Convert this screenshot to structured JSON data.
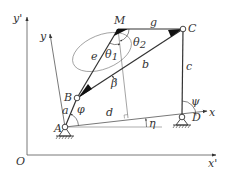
{
  "diagram": {
    "colors": {
      "line": "#333333",
      "axis": "#555555",
      "ellipse": "#777777",
      "background": "#ffffff"
    },
    "frames": {
      "global": {
        "origin_label": "O",
        "x_label": "x'",
        "y_label": "y'"
      },
      "local": {
        "x_label": "x",
        "y_label": "y"
      }
    },
    "joints": {
      "A": "A",
      "B": "B",
      "C": "C",
      "D": "D",
      "M": "M"
    },
    "links": {
      "input_crank": "a",
      "coupler": "b",
      "output_rocker": "c",
      "ground": "d",
      "coupler_side_e": "e",
      "coupler_side_g": "g"
    },
    "angles": {
      "input": "φ",
      "output": "ψ",
      "ground_tilt": "η",
      "beta": "β",
      "theta1": "θ",
      "theta1_sub": "1",
      "theta2": "θ",
      "theta2_sub": "2"
    }
  }
}
